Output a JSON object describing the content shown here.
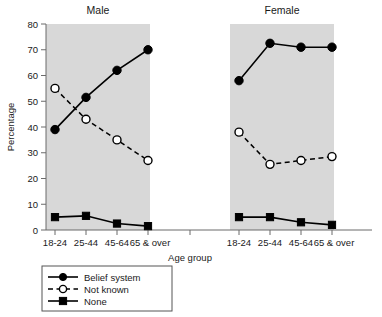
{
  "chart_data": {
    "type": "line",
    "title": "",
    "xlabel": "Age group",
    "ylabel": "Percentage",
    "ylim": [
      0,
      80
    ],
    "ytick_step": 10,
    "yticks": [
      "0",
      "10",
      "20",
      "30",
      "40",
      "50",
      "60",
      "70",
      "80"
    ],
    "categories": [
      "18-24",
      "25-44",
      "45-64",
      "65 & over"
    ],
    "grid": false,
    "legend_position": "bottom-left",
    "panels": [
      {
        "name": "male-panel",
        "title": "Male",
        "series": [
          {
            "name": "Belief system",
            "marker": "filled-circle",
            "line": "solid",
            "values": [
              39,
              51.5,
              62,
              70
            ]
          },
          {
            "name": "Not known",
            "marker": "open-circle",
            "line": "dashed",
            "values": [
              55,
              43,
              35,
              27
            ]
          },
          {
            "name": "None",
            "marker": "filled-square",
            "line": "solid",
            "values": [
              5,
              5.5,
              2.5,
              1.5
            ]
          }
        ]
      },
      {
        "name": "female-panel",
        "title": "Female",
        "series": [
          {
            "name": "Belief system",
            "marker": "filled-circle",
            "line": "solid",
            "values": [
              58,
              72.5,
              71,
              71
            ]
          },
          {
            "name": "Not known",
            "marker": "open-circle",
            "line": "dashed",
            "values": [
              38,
              25.5,
              27,
              28.5
            ]
          },
          {
            "name": "None",
            "marker": "filled-square",
            "line": "solid",
            "values": [
              5,
              5,
              3,
              2
            ]
          }
        ]
      }
    ],
    "legend": [
      {
        "label": "Belief system",
        "marker": "filled-circle",
        "line": "solid"
      },
      {
        "label": "Not known",
        "marker": "open-circle",
        "line": "dashed"
      },
      {
        "label": "None",
        "marker": "filled-square",
        "line": "solid"
      }
    ],
    "colors": {
      "panel_background": "#d8d8d8",
      "series_line": "#000000",
      "axis": "#6b6b6b",
      "figure_background": "#ffffff"
    }
  }
}
